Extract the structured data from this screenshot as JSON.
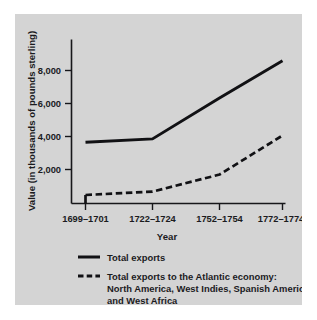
{
  "chart_data": {
    "type": "line",
    "title": "",
    "xlabel": "Year",
    "ylabel": "Value (in thousands of pounds sterling)",
    "categories": [
      "1699–1701",
      "1722–1724",
      "1752–1754",
      "1772–1774"
    ],
    "yticks": [
      "2,000",
      "4,000",
      "6,000",
      "8,000"
    ],
    "ytick_values": [
      2000,
      4000,
      6000,
      8000
    ],
    "ylim": [
      0,
      9200
    ],
    "grid": false,
    "legend_position": "below",
    "series": [
      {
        "name": "Total exports",
        "style": "solid",
        "color": "#111114",
        "values": [
          3600,
          3800,
          6200,
          8400
        ]
      },
      {
        "name": "Total exports to the Atlantic economy: North America, West Indies, Spanish America, and West Africa",
        "style": "dashed",
        "color": "#111114",
        "values": [
          500,
          700,
          1700,
          4000
        ]
      }
    ]
  },
  "legend": {
    "entries": [
      {
        "label": "Total exports",
        "style": "solid"
      },
      {
        "label_line1": "Total exports to the Atlantic economy:",
        "label_line2": "North America, West Indies, Spanish America,",
        "label_line3": "and West Africa",
        "style": "dashed"
      }
    ]
  },
  "colors": {
    "panel_background": "#d4d4d4",
    "page_background": "#ffffff",
    "ink": "#111114"
  }
}
